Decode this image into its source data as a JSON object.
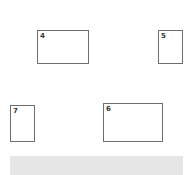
{
  "boxes": [
    {
      "id": "4",
      "label": "4",
      "x": 37,
      "y": 30,
      "w": 52,
      "h": 34
    },
    {
      "id": "5",
      "label": "5",
      "x": 158,
      "y": 30,
      "w": 25,
      "h": 34
    },
    {
      "id": "7",
      "label": "7",
      "x": 10,
      "y": 105,
      "w": 25,
      "h": 37
    },
    {
      "id": "6",
      "label": "6",
      "x": 103,
      "y": 103,
      "w": 60,
      "h": 39
    }
  ],
  "bar": {
    "x": 10,
    "y": 156,
    "w": 173,
    "h": 19,
    "color": "#e6e6e6"
  }
}
